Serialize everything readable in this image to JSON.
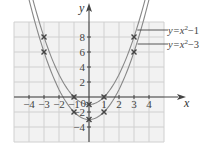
{
  "chart_data": {
    "type": "line",
    "title": "",
    "xlabel": "x",
    "ylabel": "y",
    "xlim": [
      -5,
      5
    ],
    "ylim": [
      -6,
      10
    ],
    "grid": true,
    "x_ticks": [
      -4,
      -3,
      -2,
      -1,
      1,
      2,
      3,
      4
    ],
    "y_ticks": [
      -4,
      -2,
      2,
      4,
      6,
      8
    ],
    "x_tick_labels": [
      "−4",
      "−3",
      "−2",
      "−1",
      "1",
      "2",
      "3",
      "4"
    ],
    "y_tick_labels": [
      "−4",
      "−2",
      "2",
      "4",
      "6",
      "8"
    ],
    "origin_label": "0",
    "series": [
      {
        "name": "y=x²−1",
        "label_parts": {
          "base": "y=x",
          "exp": "2",
          "tail": "−1"
        },
        "equation": "y = x^2 - 1",
        "marked_points": [
          [
            -3,
            8
          ],
          [
            -1,
            0
          ],
          [
            0,
            -1
          ],
          [
            1,
            0
          ],
          [
            3,
            8
          ]
        ]
      },
      {
        "name": "y=x²−3",
        "label_parts": {
          "base": "y=x",
          "exp": "2",
          "tail": "−3"
        },
        "equation": "y = x^2 - 3",
        "marked_points": [
          [
            -3,
            6
          ],
          [
            -1,
            -2
          ],
          [
            0,
            -3
          ],
          [
            1,
            -2
          ],
          [
            3,
            6
          ]
        ]
      }
    ],
    "legend_position": "right (leader lines to curves)",
    "colors": {
      "grid": "#d0d0d0",
      "grid_bg": "#f2f2f2",
      "curve": "#888888",
      "axis": "#444444",
      "marker": "#444444"
    }
  }
}
